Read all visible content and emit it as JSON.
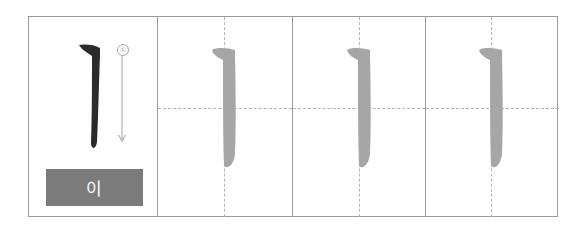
{
  "worksheet": {
    "character": "ㅣ",
    "romanization_label": "이",
    "stroke_order": [
      {
        "number": "①",
        "direction": "top-to-bottom"
      }
    ],
    "practice_cells": 3,
    "colors": {
      "model_stroke": "#2b2b2b",
      "trace_stroke": "#a6a6a6",
      "label_background": "#7b7b7b",
      "label_text": "#ffffff",
      "grid_line": "#9a9a9a",
      "guide_line": "#b4b4b4",
      "arrow": "#b0b0b0"
    }
  }
}
